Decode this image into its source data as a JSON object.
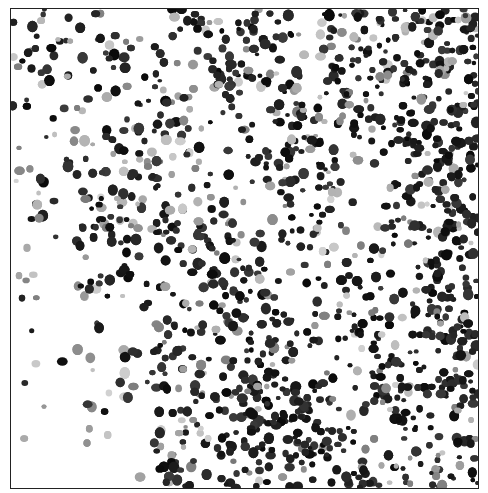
{
  "image": {
    "description": "Grayscale micrograph of densely packed dark cell nuclei on white background, denser toward the right and bottom-center, sparse at lower-left",
    "frame": {
      "x": 10,
      "y": 8,
      "width": 469,
      "height": 481,
      "border_color": "#222222"
    },
    "colors": {
      "background": "#ffffff",
      "nucleus_dark": "#111111",
      "nucleus_light": "#b8b8b8"
    },
    "seed": 7,
    "nucleus_count": 2600
  }
}
